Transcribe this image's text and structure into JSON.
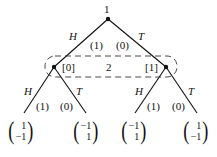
{
  "root": {
    "player": "1"
  },
  "root_actions": [
    {
      "label": "H",
      "prob": "(1)"
    },
    {
      "label": "T",
      "prob": "(0)"
    }
  ],
  "info_set": {
    "player": "2",
    "beliefs": [
      "[0]",
      "[1]"
    ]
  },
  "p2_actions": [
    {
      "label": "H",
      "prob": "(1)"
    },
    {
      "label": "T",
      "prob": "(0)"
    },
    {
      "label": "H",
      "prob": "(1)"
    },
    {
      "label": "T",
      "prob": "(0)"
    }
  ],
  "payoffs": [
    {
      "top": "1",
      "bottom": "−1"
    },
    {
      "top": "−1",
      "bottom": "1"
    },
    {
      "top": "−1",
      "bottom": "1"
    },
    {
      "top": "1",
      "bottom": "−1"
    }
  ]
}
